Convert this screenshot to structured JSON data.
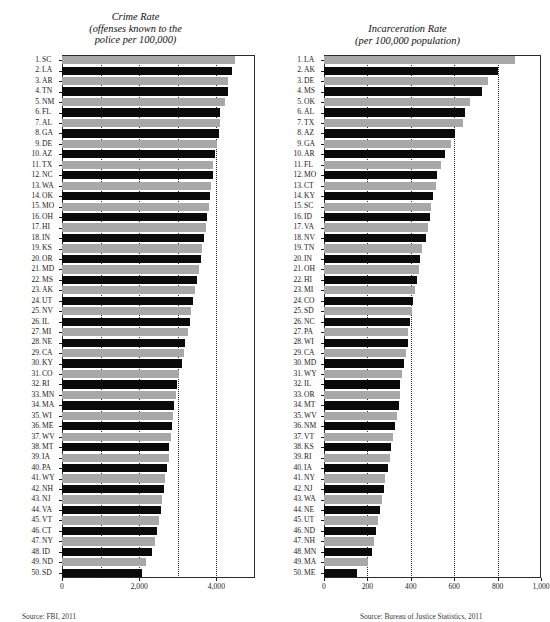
{
  "page": {
    "background": "#ffffff",
    "bar_color_odd": "#a8a8a8",
    "bar_color_even": "#0a0a0a"
  },
  "left": {
    "title_line1": "Crime Rate",
    "title_line2": "(offenses known to the",
    "title_line3": "police per 100,000)",
    "footnote": "Source: FBI, 2011"
  },
  "right": {
    "title_line1": "Incarceration Rate",
    "title_line2": "(per 100,000 population)",
    "title_line3": "",
    "footnote": "Source: Bureau of Justice Statistics, 2011"
  },
  "chart_data": [
    {
      "type": "bar",
      "orientation": "horizontal",
      "title": "Crime Rate (offenses known to the police per 100,000)",
      "xlabel": "",
      "ylabel": "",
      "xlim": [
        0,
        5000
      ],
      "xticks": [
        0,
        2000,
        4000
      ],
      "xtick_labels": [
        "0",
        "2,000",
        "4,000"
      ],
      "gridlines": [
        1000,
        2000,
        3000,
        4000
      ],
      "grid": true,
      "legend": "none",
      "categories": [
        "SC",
        "LA",
        "AR",
        "TN",
        "NM",
        "FL",
        "AL",
        "GA",
        "DE",
        "AZ",
        "TX",
        "NC",
        "WA",
        "OK",
        "MO",
        "OH",
        "HI",
        "IN",
        "KS",
        "OR",
        "MD",
        "MS",
        "AK",
        "UT",
        "NV",
        "IL",
        "MI",
        "NE",
        "CA",
        "KY",
        "CO",
        "RI",
        "MN",
        "MA",
        "WI",
        "ME",
        "WV",
        "MT",
        "IA",
        "PA",
        "WY",
        "NH",
        "NJ",
        "VA",
        "VT",
        "CT",
        "NY",
        "ID",
        "ND",
        "SD"
      ],
      "ranks": [
        1,
        2,
        3,
        4,
        5,
        6,
        7,
        8,
        9,
        10,
        11,
        12,
        13,
        14,
        15,
        16,
        17,
        18,
        19,
        20,
        21,
        22,
        23,
        24,
        25,
        26,
        27,
        28,
        29,
        30,
        31,
        32,
        33,
        34,
        35,
        36,
        37,
        38,
        39,
        40,
        41,
        42,
        43,
        44,
        45,
        46,
        47,
        48,
        49,
        50
      ],
      "values": [
        4490,
        4400,
        4310,
        4300,
        4220,
        4100,
        4090,
        4060,
        4020,
        3960,
        3920,
        3900,
        3870,
        3830,
        3800,
        3760,
        3720,
        3670,
        3630,
        3590,
        3550,
        3500,
        3450,
        3400,
        3350,
        3320,
        3260,
        3180,
        3160,
        3100,
        3020,
        2990,
        2950,
        2900,
        2880,
        2850,
        2820,
        2780,
        2760,
        2720,
        2660,
        2630,
        2600,
        2560,
        2520,
        2460,
        2400,
        2320,
        2180,
        2060
      ]
    },
    {
      "type": "bar",
      "orientation": "horizontal",
      "title": "Incarceration Rate (per 100,000 population)",
      "xlabel": "",
      "ylabel": "",
      "xlim": [
        0,
        1000
      ],
      "xticks": [
        0,
        200,
        400,
        600,
        800,
        1000
      ],
      "xtick_labels": [
        "0",
        "200",
        "400",
        "600",
        "800",
        "1,000"
      ],
      "gridlines": [
        200,
        400,
        600,
        800
      ],
      "grid": true,
      "legend": "none",
      "categories": [
        "LA",
        "AK",
        "DE",
        "MS",
        "OK",
        "AL",
        "TX",
        "AZ",
        "GA",
        "AR",
        "FL",
        "MO",
        "CT",
        "KY",
        "SC",
        "ID",
        "VA",
        "NV",
        "TN",
        "IN",
        "OH",
        "HI",
        "MI",
        "CO",
        "SD",
        "NC",
        "PA",
        "WI",
        "CA",
        "MD",
        "WY",
        "IL",
        "OR",
        "MT",
        "WV",
        "NM",
        "VT",
        "KS",
        "RI",
        "IA",
        "NY",
        "NJ",
        "WA",
        "NE",
        "UT",
        "ND",
        "NH",
        "MN",
        "MA",
        "ME"
      ],
      "ranks": [
        1,
        2,
        3,
        4,
        5,
        6,
        7,
        8,
        9,
        10,
        11,
        12,
        13,
        14,
        15,
        16,
        17,
        18,
        19,
        20,
        21,
        22,
        23,
        24,
        25,
        26,
        27,
        28,
        29,
        30,
        31,
        32,
        33,
        34,
        35,
        36,
        37,
        38,
        39,
        40,
        41,
        42,
        43,
        44,
        45,
        46,
        47,
        48,
        49,
        50
      ],
      "values": [
        881,
        800,
        756,
        726,
        672,
        650,
        642,
        602,
        585,
        558,
        538,
        523,
        518,
        500,
        495,
        488,
        480,
        470,
        452,
        442,
        438,
        430,
        420,
        410,
        405,
        395,
        388,
        385,
        380,
        370,
        358,
        352,
        348,
        344,
        338,
        325,
        318,
        310,
        305,
        295,
        282,
        275,
        268,
        260,
        248,
        238,
        230,
        220,
        205,
        152
      ]
    }
  ]
}
